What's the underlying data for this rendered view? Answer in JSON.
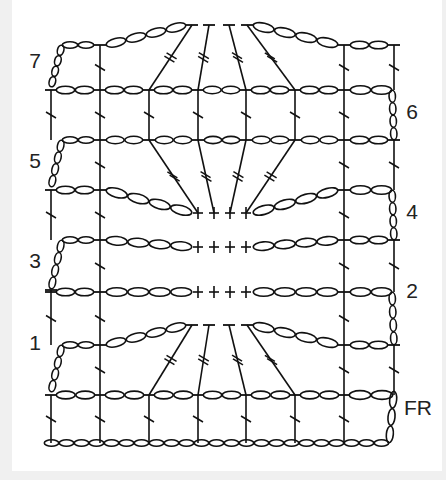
{
  "diagram": {
    "type": "crochet-stitch-chart",
    "colors": {
      "ink": "#111111",
      "background": "#ffffff",
      "page": "#f0f0f0"
    },
    "row_labels": [
      {
        "id": "row-7",
        "text": "7",
        "side": "left"
      },
      {
        "id": "row-6",
        "text": "6",
        "side": "right"
      },
      {
        "id": "row-5",
        "text": "5",
        "side": "left"
      },
      {
        "id": "row-4",
        "text": "4",
        "side": "right"
      },
      {
        "id": "row-3",
        "text": "3",
        "side": "left"
      },
      {
        "id": "row-2",
        "text": "2",
        "side": "right"
      },
      {
        "id": "row-1",
        "text": "1",
        "side": "left"
      },
      {
        "id": "row-fr",
        "text": "FR",
        "side": "right"
      }
    ],
    "legend_symbols": {
      "chain": "oval",
      "double_crochet": "T-with-one-slash",
      "treble_crochet": "T-with-two-slashes",
      "single_crochet": "+"
    },
    "columns": 8,
    "foundation_chain_count": 23
  }
}
